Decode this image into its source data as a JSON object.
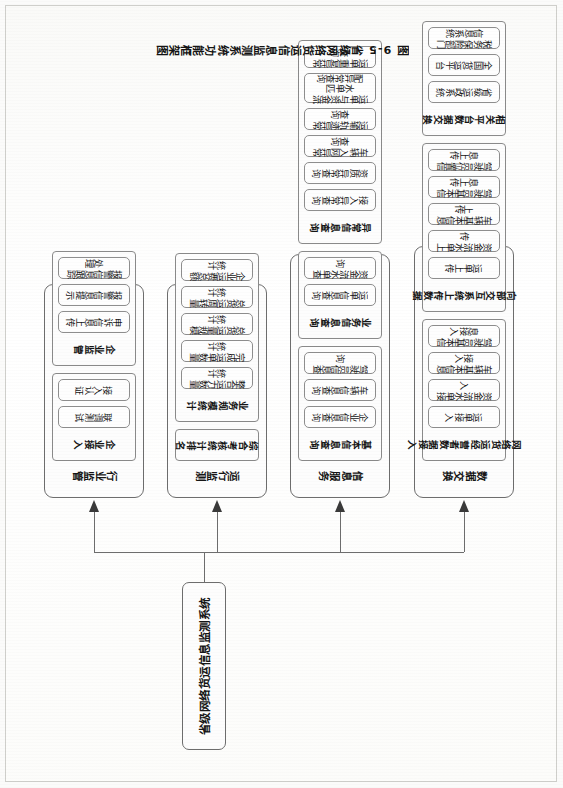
{
  "figure": {
    "caption": "图 9-5  省级网络货运信息监测系统功能框架图",
    "root": "省级网络货运信息监测系统"
  },
  "columns": [
    {
      "id": "industry-supervision",
      "title": "行业监管",
      "groups": [
        {
          "title": "企业接入",
          "items": [
            "联调测试",
            "接入认证"
          ]
        },
        {
          "title": "企业监管",
          "items": [
            "申诉信息上传",
            "报警信息提示",
            "报警信息跟踪处理"
          ]
        }
      ]
    },
    {
      "id": "operation-monitoring",
      "title": "运行监测",
      "groups": [
        {
          "title": "综合考核统计排名",
          "items": []
        },
        {
          "title": "业务规模统计",
          "items": [
            "整合运力数量统计",
            "完成运单数量统计",
            "总货运量规模统计",
            "总货运周转量统计",
            "企业运费总额统计"
          ]
        }
      ]
    },
    {
      "id": "information-service",
      "title": "信息服务",
      "groups": [
        {
          "title": "基本信息查询",
          "items": [
            "企业信息查询",
            "车辆信息查询",
            "驾驶员信息查询"
          ]
        },
        {
          "title": "业务信息查询",
          "items": [
            "运单信息查询",
            "资金流水单查询"
          ]
        },
        {
          "title": "异常信息查询",
          "items": [
            "接入异常查询",
            "资质异常查询",
            "车辆入网异常查询",
            "运输轨迹异常查询",
            "运单与资金流水单匹\n配异常查询",
            "运单重复异常查询"
          ]
        }
      ]
    },
    {
      "id": "data-exchange",
      "title": "数据交换",
      "groups": [
        {
          "title": "网络货运经营者数据接入",
          "items": [
            "运单接入",
            "资金流水单接入",
            "车辆基本信息接入",
            "驾驶员基本信息接入"
          ]
        },
        {
          "title": "向部交互系统上传数据",
          "items": [
            "运单上传",
            "资金流水单上传",
            "车辆基本信息上传",
            "驾驶员基本信息上传",
            "驾驶员位置信息上传"
          ]
        },
        {
          "title": "相关平台数据交换",
          "items": [
            "省级运政系统",
            "全国货运平台",
            "税务保险部门信息系统"
          ]
        }
      ]
    }
  ],
  "style": {
    "line_color": "#6d6d6d",
    "box_fill": "#fdfdfd",
    "text_color": "#161616"
  }
}
